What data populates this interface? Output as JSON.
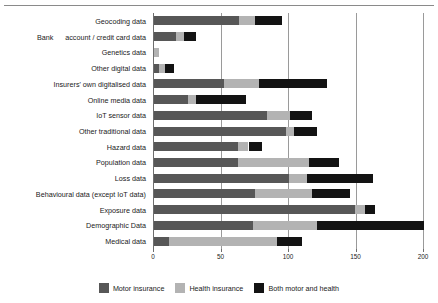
{
  "header": {
    "crumb": ""
  },
  "chart_data": {
    "type": "bar",
    "orientation": "horizontal",
    "stacked": true,
    "title": "",
    "xlabel": "",
    "ylabel": "",
    "xlim": [
      0,
      200
    ],
    "xticks": [
      0,
      50,
      100,
      150,
      200
    ],
    "xticklabels": [
      "0",
      "50",
      "100",
      "150",
      "200"
    ],
    "grid": "vertical",
    "legend_position": "bottom-center",
    "categories": [
      "Geocoding data",
      "Bank account / credit card data",
      "Genetics data",
      "Other digital data",
      "Insurers' own digitalised data",
      "Online media data",
      "IoT sensor data",
      "Other traditional data",
      "Hazard data",
      "Population data",
      "Loss data",
      "Behavioural data (except IoT data)",
      "Exposure data",
      "Demographic Data",
      "Medical data"
    ],
    "series": [
      {
        "name": "Motor insurance",
        "color": "#575757",
        "values": [
          63,
          16,
          0,
          4,
          52,
          25,
          84,
          98,
          62,
          62,
          100,
          75,
          149,
          73,
          11
        ]
      },
      {
        "name": "Health insurance",
        "color": "#b3b3b3",
        "values": [
          12,
          6,
          4,
          4,
          26,
          6,
          17,
          6,
          8,
          53,
          13,
          42,
          7,
          48,
          80
        ]
      },
      {
        "name": "Both motor and health",
        "color": "#131313",
        "values": [
          20,
          9,
          0,
          7,
          50,
          37,
          16,
          17,
          10,
          22,
          49,
          28,
          8,
          79,
          19
        ]
      }
    ],
    "totals": [
      95,
      31,
      4,
      15,
      128,
      68,
      117,
      121,
      80,
      137,
      162,
      145,
      164,
      200,
      110
    ],
    "legend": [
      {
        "label": "Motor insurance",
        "swatch": "motor"
      },
      {
        "label": "Health insurance",
        "swatch": "health"
      },
      {
        "label": "Both motor and health",
        "swatch": "both"
      }
    ]
  }
}
